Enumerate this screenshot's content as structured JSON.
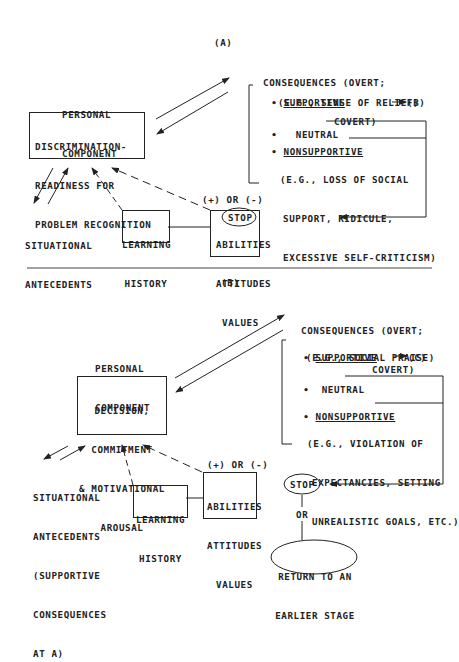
{
  "panel_a": {
    "label": "(A)",
    "personal_component": [
      "PERSONAL",
      "COMPONENT"
    ],
    "main_box": [
      "DISCRIMINATION-",
      "READINESS FOR",
      "PROBLEM RECOGNITION"
    ],
    "consequences_title": [
      "CONSEQUENCES (OVERT;",
      "COVERT)"
    ],
    "supportive": "SUPPORTIVE",
    "supportive_example": "(E.G., SENSE OF RELIEF)",
    "supportive_target": "(B)",
    "neutral": "NEUTRAL",
    "nonsupportive": "NONSUPPORTIVE",
    "nonsupportive_example": [
      "(E.G., LOSS OF SOCIAL",
      "SUPPORT, RIDICULE,",
      "EXCESSIVE SELF-CRITICISM)"
    ],
    "stop": "STOP",
    "situational": [
      "SITUATIONAL",
      "ANTECEDENTS"
    ],
    "learning_history": [
      "LEARNING",
      "HISTORY"
    ],
    "abilities": [
      "ABILITIES",
      "ATTITUDES",
      "VALUES"
    ],
    "plus_minus": "(+) OR (-)"
  },
  "panel_b": {
    "label": "(B)",
    "personal_component": [
      "PERSONAL",
      "COMPONENT"
    ],
    "main_box": [
      "DECISION,",
      "COMMITMENT",
      "& MOTIVATIONAL",
      "AROUSAL"
    ],
    "consequences_title": [
      "CONSEQUENCES (OVERT;",
      "COVERT)"
    ],
    "supportive": "SUPPORTIVE",
    "supportive_example": "(E.G., SOCIAL PRAISE)",
    "supportive_target": "(C)",
    "neutral": "NEUTRAL",
    "nonsupportive": "NONSUPPORTIVE",
    "nonsupportive_example": [
      "(E.G., VIOLATION OF",
      "EXPECTANCIES, SETTING",
      "UNREALISTIC GOALS, ETC.)"
    ],
    "stop": "STOP",
    "or": "OR",
    "return": [
      "RETURN TO AN",
      "EARLIER STAGE"
    ],
    "situational": [
      "SITUATIONAL",
      "ANTECEDENTS",
      "(SUPPORTIVE",
      "CONSEQUENCES",
      "AT A)"
    ],
    "learning_history": [
      "LEARNING",
      "HISTORY"
    ],
    "abilities": [
      "ABILITIES",
      "ATTITUDES",
      "VALUES"
    ],
    "plus_minus": "(+) OR (-)"
  },
  "bullet": "•"
}
